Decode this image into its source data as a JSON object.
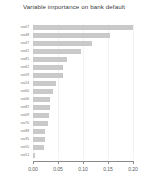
{
  "chart_data": {
    "type": "bar",
    "orientation": "horizontal",
    "title": "Variable importance on bank default",
    "xlabel": "",
    "ylabel": "",
    "xlim": [
      0.0,
      0.2
    ],
    "xticks": [
      "0.00",
      "0.05",
      "0.10",
      "0.15",
      "0.20"
    ],
    "xtick_values": [
      0.0,
      0.05,
      0.1,
      0.15,
      0.2
    ],
    "grid": true,
    "legend": null,
    "bar_color": "#c9c9c9",
    "categories": [
      "var07",
      "var48",
      "var47",
      "var41",
      "var81",
      "var62",
      "var59",
      "var24",
      "var60",
      "var06",
      "var82",
      "var09",
      "var70",
      "var88",
      "var35",
      "var55",
      "var51"
    ],
    "values": [
      0.2,
      0.154,
      0.117,
      0.095,
      0.068,
      0.06,
      0.059,
      0.046,
      0.039,
      0.034,
      0.033,
      0.032,
      0.029,
      0.024,
      0.023,
      0.022,
      0.004
    ]
  }
}
